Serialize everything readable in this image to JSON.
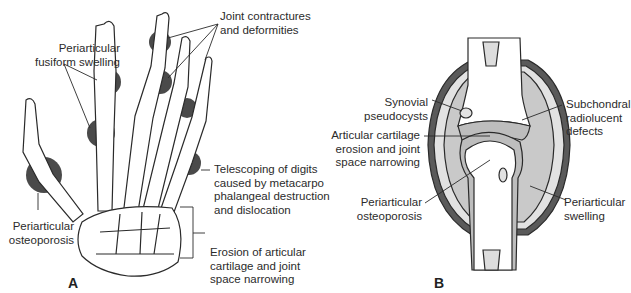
{
  "panels": {
    "a": {
      "letter": "A",
      "subject": "Rheumatoid arthritis hand skeleton",
      "labels": {
        "fusiform": [
          "Periarticular",
          "fusiform swelling"
        ],
        "contractures": [
          "Joint contractures",
          "and deformities"
        ],
        "telescoping": [
          "Telescoping of digits",
          "caused by metacarpo",
          "phalangeal destruction",
          "and dislocation"
        ],
        "osteoporosis": [
          "Periarticular",
          "osteoporosis"
        ],
        "erosion": [
          "Erosion of articular",
          "cartilage and joint",
          "space narrowing"
        ]
      }
    },
    "b": {
      "letter": "B",
      "subject": "Cross-section of affected joint",
      "labels": {
        "pseudocysts": [
          "Synovial",
          "pseudocysts"
        ],
        "subchondral": [
          "Subchondral",
          "radiolucent",
          "defects"
        ],
        "cartilage": [
          "Articular cartilage",
          "erosion and joint",
          "space narrowing"
        ],
        "osteoporosis": [
          "Periarticular",
          "osteoporosis"
        ],
        "swelling": [
          "Periarticular",
          "swelling"
        ]
      }
    }
  },
  "colors": {
    "ink": "#2a2a2a",
    "bone": "#ffffff",
    "swelling_dark": "#4a4a4a",
    "soft_tissue": "#c9c9c9",
    "synovium_light": "#e2e2e2"
  }
}
